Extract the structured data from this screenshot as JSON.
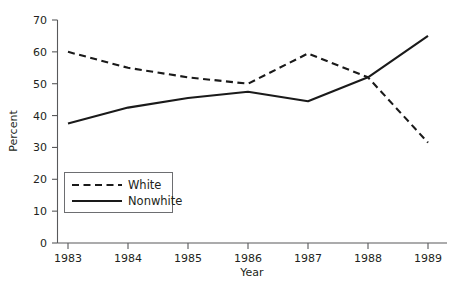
{
  "chart_data": {
    "type": "line",
    "title": "",
    "xlabel": "Year",
    "ylabel": "Percent",
    "x": [
      1983,
      1984,
      1985,
      1986,
      1987,
      1988,
      1989
    ],
    "xtick_labels": [
      "1983",
      "1984",
      "1985",
      "1986",
      "1987",
      "1988",
      "1989"
    ],
    "ytick_labels": [
      "0",
      "10",
      "20",
      "30",
      "40",
      "50",
      "60",
      "70"
    ],
    "yticks": [
      0,
      10,
      20,
      30,
      40,
      50,
      60,
      70
    ],
    "xlim": [
      1983,
      1989
    ],
    "ylim": [
      0,
      70
    ],
    "grid": false,
    "legend_position": "lower left",
    "series": [
      {
        "name": "White",
        "style": "dashed",
        "color": "#1a1a1a",
        "values": [
          60,
          55,
          52,
          50,
          59.5,
          52,
          31.5
        ]
      },
      {
        "name": "Nonwhite",
        "style": "solid",
        "color": "#1a1a1a",
        "values": [
          37.5,
          42.5,
          45.5,
          47.5,
          44.5,
          52,
          65
        ]
      }
    ]
  },
  "legend": {
    "entries": [
      {
        "label": "White",
        "style": "dashed"
      },
      {
        "label": "Nonwhite",
        "style": "solid"
      }
    ]
  },
  "caption": {
    "ghost_text": ""
  }
}
